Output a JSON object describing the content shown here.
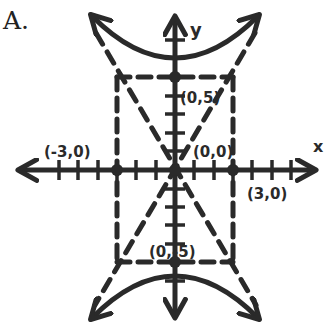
{
  "problem_label": "A.",
  "diagram": {
    "type": "hyperbola-graph",
    "equation_form": "vertical hyperbola y^2/25 - x^2/9 = 1",
    "axes": {
      "x_label": "x",
      "y_label": "y",
      "x_ticks_each_side": 8,
      "y_ticks_each_side": 8
    },
    "points": [
      {
        "label": "(0,5)",
        "x": 0,
        "y": 5
      },
      {
        "label": "(0,0)",
        "x": 0,
        "y": 0
      },
      {
        "label": "(-3,0)",
        "x": -3,
        "y": 0
      },
      {
        "label": "(3,0)",
        "x": 3,
        "y": 0
      },
      {
        "label": "(0,-5)",
        "x": 0,
        "y": -5
      }
    ],
    "guide_box": {
      "x_min": -3,
      "x_max": 3,
      "y_min": -5,
      "y_max": 5,
      "style": "dashed"
    },
    "asymptotes": [
      "y = 5/3 x",
      "y = -5/3 x"
    ],
    "colors": {
      "ink": "#2a2a2a",
      "background": "#ffffff"
    }
  }
}
